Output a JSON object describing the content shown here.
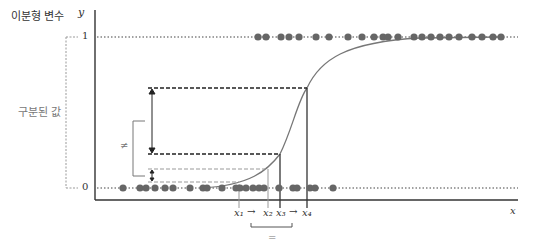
{
  "labels": {
    "y_axis_title": "이분형 변수",
    "y_axis_symbol": "y",
    "x_axis_symbol": "x",
    "y_tick_1": "1",
    "y_tick_0": "0",
    "bracket_label": "구분된 값",
    "not_equal": "≠",
    "equal": "=",
    "x1": "x₁",
    "x2": "x₂",
    "x3": "x₃",
    "x4": "x₄",
    "arrow": "→"
  },
  "colors": {
    "axis": "#333333",
    "dots": "#666666",
    "curve": "#777777",
    "dashed_dark": "#222222",
    "dashed_light": "#999999"
  },
  "diagram": {
    "top_row_dots_x": [
      258,
      266,
      281,
      289,
      299,
      316,
      329,
      348,
      362,
      374,
      383,
      388,
      398,
      414,
      422,
      431,
      440,
      449,
      459,
      472,
      482,
      493,
      501
    ],
    "bottom_row_dots_x": [
      123,
      140,
      146,
      155,
      165,
      173,
      190,
      203,
      207,
      222,
      236,
      240,
      246,
      253,
      259,
      264,
      279,
      293,
      297,
      310,
      315,
      333
    ],
    "x_marks": [
      239,
      268,
      280,
      307
    ]
  }
}
